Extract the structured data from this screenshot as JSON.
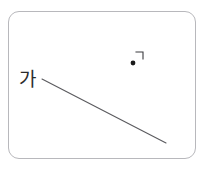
{
  "diagram": {
    "background_color": "#ffffff",
    "frame": {
      "name": "rounded-rectangle-frame",
      "x": 8,
      "y": 11,
      "width": 188,
      "height": 148,
      "corner_radius": 11,
      "stroke_color": "#b8b8bc",
      "stroke_width": 1,
      "fill_color": "#ffffff"
    },
    "labels": [
      {
        "id": "ga",
        "text": "가",
        "x": 19,
        "y": 69,
        "font_size": 19,
        "color": "#2b2b2b"
      }
    ],
    "segments": [
      {
        "id": "main-line",
        "x1": 42,
        "y1": 79,
        "x2": 166,
        "y2": 143,
        "stroke_color": "#5a5a5e",
        "stroke_width": 1.1
      }
    ],
    "points": [
      {
        "id": "marked-point",
        "cx": 133,
        "cy": 63,
        "r": 2.4,
        "fill_color": "#1a1a1a"
      }
    ],
    "right_angle_marks": [
      {
        "id": "right-angle-symbol",
        "corner_x": 143,
        "corner_y": 52,
        "arm_x": 136,
        "arm_y": 52,
        "arm_y_end": 59,
        "stroke_color": "#3a3a3e",
        "stroke_width": 1.1
      }
    ]
  }
}
